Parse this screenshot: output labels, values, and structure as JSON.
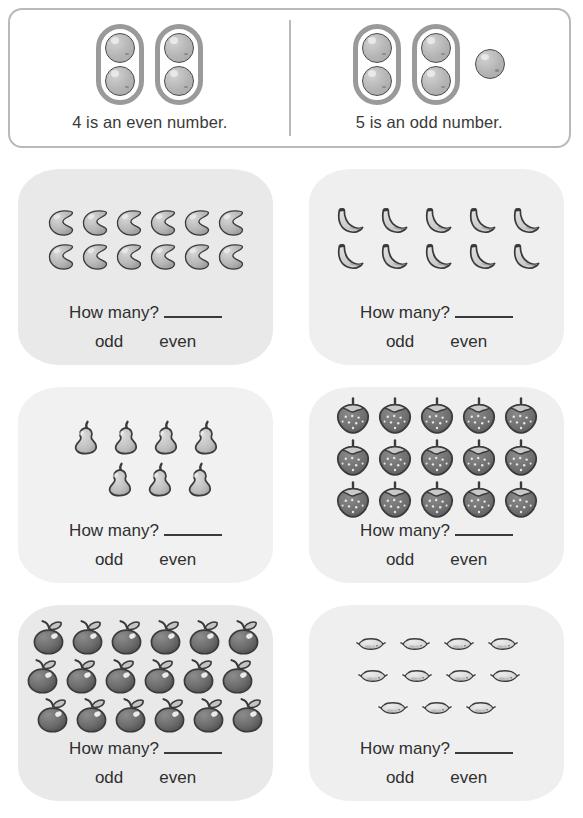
{
  "worksheet": {
    "title": "Odd and Even Numbers"
  },
  "example": {
    "left": {
      "caption": "4 is an even number.",
      "number": 4,
      "parity": "even",
      "pairs": 2,
      "leftover": 0,
      "icon": "ball-icon"
    },
    "right": {
      "caption": "5 is an odd number.",
      "number": 5,
      "parity": "odd",
      "pairs": 2,
      "leftover": 1,
      "icon": "ball-icon"
    }
  },
  "labels": {
    "prompt": "How many?",
    "blank": "",
    "odd": "odd",
    "even": "even"
  },
  "problems": [
    {
      "index": 1,
      "icon": "bean-icon",
      "item": "bean",
      "count": 12,
      "rows": [
        6,
        6
      ],
      "answer_parity": "even",
      "tint": "tint-mid"
    },
    {
      "index": 2,
      "icon": "banana-icon",
      "item": "banana",
      "count": 10,
      "rows": [
        5,
        5
      ],
      "answer_parity": "even",
      "tint": "tint-pale"
    },
    {
      "index": 3,
      "icon": "pear-icon",
      "item": "pear",
      "count": 7,
      "rows": [
        4,
        3
      ],
      "answer_parity": "odd",
      "tint": "tint-light"
    },
    {
      "index": 4,
      "icon": "strawberry-icon",
      "item": "strawberry",
      "count": 15,
      "rows": [
        5,
        5,
        5
      ],
      "answer_parity": "odd",
      "tint": "tint-pale"
    },
    {
      "index": 5,
      "icon": "apple-icon",
      "item": "apple",
      "count": 18,
      "rows": [
        6,
        6,
        6
      ],
      "answer_parity": "even",
      "tint": "tint-mid"
    },
    {
      "index": 6,
      "icon": "lemon-icon",
      "item": "lemon",
      "count": 11,
      "rows": [
        4,
        4,
        3
      ],
      "answer_parity": "odd",
      "tint": "tint-pale"
    }
  ],
  "colors": {
    "card_background": "#e9e9e9",
    "card_background_pale": "#f1f1f1",
    "outline": "#3a3a3a",
    "fill_light": "#cfcfcf",
    "fill_dark": "#6e6e6e",
    "box_border": "#b9b9b9"
  }
}
